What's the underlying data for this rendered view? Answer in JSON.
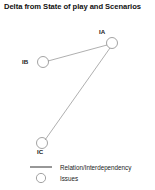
{
  "title": "Delta from State of play and Scenarios",
  "colors": {
    "background": "#ffffff",
    "node_stroke": "#8c8c8c",
    "edge_stroke": "#9a9a9a",
    "text": "#1a1a1a"
  },
  "diagram": {
    "nodes": [
      {
        "id": "IA",
        "label": "IA",
        "cx": 112,
        "cy": 43,
        "r": 5.5,
        "label_x": 99,
        "label_y": 28
      },
      {
        "id": "IB",
        "label": "IB",
        "cx": 43,
        "cy": 62,
        "r": 5.5,
        "label_x": 22,
        "label_y": 58
      },
      {
        "id": "IC",
        "label": "IC",
        "cx": 42,
        "cy": 143,
        "r": 5.5,
        "label_x": 37,
        "label_y": 148
      }
    ],
    "edges": [
      {
        "from": "IA",
        "to": "IB",
        "x1": 107,
        "y1": 45,
        "x2": 48,
        "y2": 61
      },
      {
        "from": "IA",
        "to": "IC",
        "x1": 110,
        "y1": 48,
        "x2": 45,
        "y2": 140
      }
    ]
  },
  "legend": {
    "items": [
      {
        "symbol": "line",
        "label": "Relation/Interdependency"
      },
      {
        "symbol": "circle",
        "label": "Issues"
      }
    ],
    "line": {
      "x1": 30,
      "y1": 167,
      "x2": 52,
      "y2": 167
    },
    "circle": {
      "cx": 41,
      "cy": 178,
      "r": 4.6
    },
    "label_x": 60,
    "label_y_line": 164,
    "label_y_circle": 175
  }
}
